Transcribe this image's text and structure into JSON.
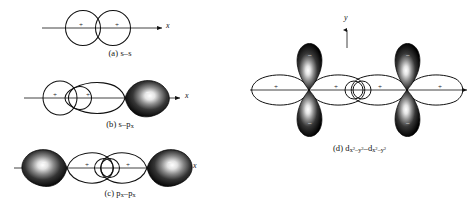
{
  "figure": {
    "background_color": "#ffffff",
    "ink_color": "#111111",
    "lobe_fill_color": "#000000",
    "lobe_highlight_color": "#ffffff"
  },
  "panels": [
    {
      "id": "a",
      "caption": "(a) s–s",
      "caption_plain": "(a) s-s",
      "axis_label": "x",
      "axis_direction": "horizontal-right",
      "orbital_left": "s",
      "orbital_right": "s",
      "signs": [
        "+",
        "+"
      ],
      "shaded_lobes": 0
    },
    {
      "id": "b",
      "caption_prefix": "(b) s–p",
      "caption_subscript": "x",
      "caption_plain": "(b) s-px",
      "axis_label": "x",
      "axis_direction": "horizontal-right",
      "orbital_left": "s",
      "orbital_right": "p_x",
      "signs": [
        "+",
        "+",
        "−"
      ],
      "shaded_lobes": 1
    },
    {
      "id": "c",
      "caption_prefix": "(c) p",
      "caption_subscript": "x",
      "caption_middle": "–p",
      "caption_subscript2": "x",
      "caption_plain": "(c) px-px",
      "axis_label": "x",
      "axis_direction": "horizontal-right",
      "orbital_left": "p_x",
      "orbital_right": "p_x",
      "signs": [
        "−",
        "+",
        "+",
        "−"
      ],
      "shaded_lobes": 2
    },
    {
      "id": "d",
      "caption_prefix": "(d) d",
      "caption_sub_base": "x",
      "caption_sub_sup": "2",
      "caption_sub_mid": "–y",
      "caption_sub_sup2": "2",
      "caption_plain": "(d) dx2-y2-dx2-y2",
      "axis_label_x": "x",
      "axis_label_y": "y",
      "orbital_left": "d_x2-y2",
      "orbital_right": "d_x2-y2",
      "signs_horizontal": [
        "+",
        "+",
        "+",
        "+"
      ],
      "signs_vertical": [
        "−",
        "−",
        "−",
        "−"
      ],
      "shaded_lobes": 4
    }
  ]
}
